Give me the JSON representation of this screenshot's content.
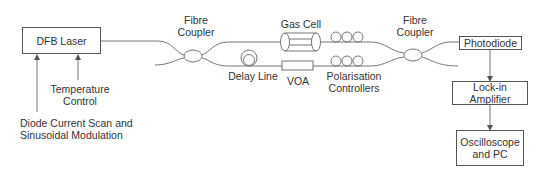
{
  "diagram": {
    "colors": {
      "line": "#666666",
      "text": "#333333",
      "box_border": "#555555"
    },
    "boxes": {
      "laser": "DFB Laser",
      "photodiode": "Photodiode",
      "lockin": "Lock-in Amplifier",
      "scope_line1": "Oscilloscope",
      "scope_line2": "and PC"
    },
    "labels": {
      "coupler1_line1": "Fibre",
      "coupler1_line2": "Coupler",
      "coupler2_line1": "Fibre",
      "coupler2_line2": "Coupler",
      "gas_cell": "Gas Cell",
      "delay_line": "Delay Line",
      "voa": "VOA",
      "pol_line1": "Polarisation",
      "pol_line2": "Controllers",
      "temp_line1": "Temperature",
      "temp_line2": "Control",
      "diode_line1": "Diode Current Scan and",
      "diode_line2": "Sinusoidal Modulation"
    },
    "components": [
      {
        "name": "DFB Laser",
        "type": "box"
      },
      {
        "name": "Fibre Coupler",
        "type": "coupler"
      },
      {
        "name": "Gas Cell",
        "type": "cylinder",
        "path": "upper"
      },
      {
        "name": "Delay Line",
        "type": "fiber-loop",
        "path": "lower"
      },
      {
        "name": "VOA",
        "type": "box",
        "path": "lower"
      },
      {
        "name": "Polarisation Controllers",
        "type": "fiber-loops",
        "count_per_path": 3
      },
      {
        "name": "Fibre Coupler",
        "type": "coupler"
      },
      {
        "name": "Photodiode",
        "type": "box"
      },
      {
        "name": "Lock-in Amplifier",
        "type": "box"
      },
      {
        "name": "Oscilloscope and PC",
        "type": "box"
      }
    ],
    "connections": [
      [
        "Diode Current Scan and Sinusoidal Modulation",
        "DFB Laser"
      ],
      [
        "Temperature Control",
        "DFB Laser"
      ],
      [
        "DFB Laser",
        "Fibre Coupler 1"
      ],
      [
        "Fibre Coupler 1",
        "Gas Cell"
      ],
      [
        "Fibre Coupler 1",
        "Delay Line"
      ],
      [
        "Delay Line",
        "VOA"
      ],
      [
        "Gas Cell",
        "Polarisation Controllers"
      ],
      [
        "VOA",
        "Polarisation Controllers"
      ],
      [
        "Polarisation Controllers",
        "Fibre Coupler 2"
      ],
      [
        "Fibre Coupler 2",
        "Photodiode"
      ],
      [
        "Photodiode",
        "Lock-in Amplifier"
      ],
      [
        "Lock-in Amplifier",
        "Oscilloscope and PC"
      ]
    ]
  }
}
